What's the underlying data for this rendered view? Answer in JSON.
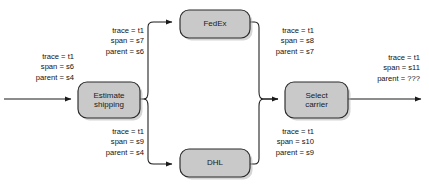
{
  "diagram": {
    "type": "flow-diagram",
    "colors": {
      "node_fill": "#c9c9c9",
      "node_stroke": "#2b2b2b",
      "edge_stroke": "#1a1a1a",
      "text": "#111111",
      "background": "#ffffff"
    },
    "nodes": [
      {
        "id": "estimate",
        "label_line1": "Estimate",
        "label_line2": "shipping"
      },
      {
        "id": "fedex",
        "label_line1": "FedEx",
        "label_line2": ""
      },
      {
        "id": "dhl",
        "label_line1": "DHL",
        "label_line2": ""
      },
      {
        "id": "select",
        "label_line1": "Select",
        "label_line2": "carrier"
      }
    ],
    "labels": [
      {
        "id": "inbound",
        "trace": "trace = t1",
        "span": "span = s6",
        "parent": "parent = s4"
      },
      {
        "id": "to-fedex",
        "trace": "trace = t1",
        "span": "span = s7",
        "parent": "parent = s6"
      },
      {
        "id": "from-fedex",
        "trace": "trace = t1",
        "span": "span = s8",
        "parent": "parent = s7"
      },
      {
        "id": "to-dhl",
        "trace": "trace = t1",
        "span": "span = s9",
        "parent": "parent = s4"
      },
      {
        "id": "from-dhl",
        "trace": "trace = t1",
        "span": "span = s10",
        "parent": "parent = s9"
      },
      {
        "id": "outbound",
        "trace": "trace = t1",
        "span": "span = s11",
        "parent": "parent = ???"
      }
    ]
  }
}
